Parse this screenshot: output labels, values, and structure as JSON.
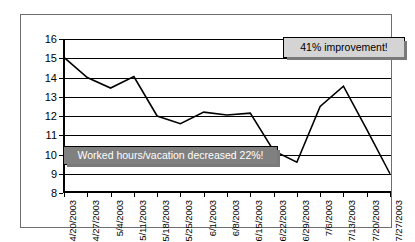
{
  "chart_data": {
    "type": "line",
    "title": "",
    "xlabel": "",
    "ylabel": "",
    "ylim": [
      8,
      16
    ],
    "ytick_step": 1,
    "grid": true,
    "legend": "none",
    "categories": [
      "4/20/2003",
      "4/27/2003",
      "5/4/2003",
      "5/11/2003",
      "5/18/2003",
      "5/25/2003",
      "6/1/2003",
      "6/8/2003",
      "6/15/2003",
      "6/22/2003",
      "6/29/2003",
      "7/6/2003",
      "7/13/2003",
      "7/20/2003",
      "7/27/2003"
    ],
    "values": [
      15.05,
      14.0,
      13.45,
      14.05,
      12.0,
      11.6,
      12.2,
      12.05,
      12.15,
      10.2,
      9.6,
      12.5,
      13.55,
      11.3,
      9.0
    ],
    "ytick_labels": [
      "16",
      "15",
      "14",
      "13",
      "12",
      "11",
      "10",
      "9",
      "8"
    ],
    "series_color": "#000000",
    "annotations": [
      {
        "id": "improvement",
        "text": "41% improvement!",
        "fill": "#d4d4d4",
        "text_color": "#000000"
      },
      {
        "id": "worked-hours",
        "text": "Worked hours/vacation decreased 22%!",
        "fill": "#808080",
        "text_color": "#ffffff"
      }
    ]
  }
}
